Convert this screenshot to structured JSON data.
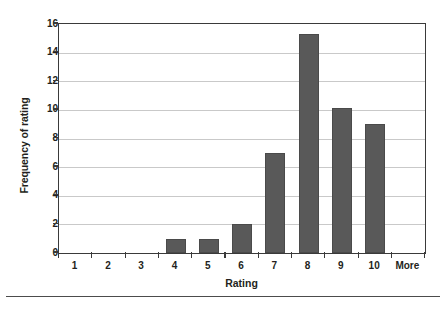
{
  "chart_data": {
    "type": "bar",
    "title": "",
    "xlabel": "Rating",
    "ylabel": "Frequency of rating",
    "categories": [
      "1",
      "2",
      "3",
      "4",
      "5",
      "6",
      "7",
      "8",
      "9",
      "10",
      "More"
    ],
    "values": [
      0,
      0,
      0,
      1,
      1,
      2,
      7,
      15.3,
      10.1,
      9,
      0
    ],
    "ylim": [
      0,
      16
    ],
    "yticks": [
      0,
      2,
      4,
      6,
      8,
      10,
      12,
      14,
      16
    ],
    "ytick_labels": [
      "0",
      "2",
      "4",
      "6",
      "8",
      "10",
      "12",
      "14",
      "16"
    ],
    "grid": true,
    "grid_axis": "y",
    "legend": false,
    "bar_color": "#595959",
    "grid_color": "#c9c9c9",
    "axis_color": "#3a3a3a",
    "text_color": "#231f20",
    "background": "#ffffff"
  },
  "figure": {
    "y_axis_title": "Frequency of rating",
    "x_axis_title": "Rating"
  }
}
